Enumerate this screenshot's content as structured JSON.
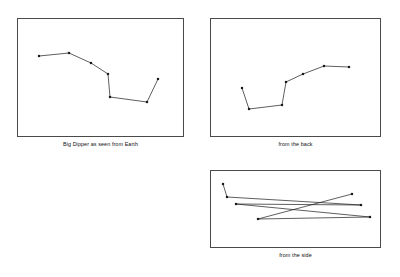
{
  "figure": {
    "background_color": "#ffffff",
    "stroke_color": "#1a1a1a",
    "frame_color": "#4a4a4a",
    "star_marker": "square"
  },
  "panels": [
    {
      "id": "earth",
      "caption": "Big Dipper as seen from Earth",
      "view": "front",
      "star_count": 7,
      "viewbox": "0 0 167 119",
      "stars": [
        {
          "name": "Alkaid",
          "x": 22,
          "y": 38
        },
        {
          "name": "Mizar",
          "x": 52,
          "y": 35
        },
        {
          "name": "Alioth",
          "x": 74,
          "y": 45
        },
        {
          "name": "Megrez",
          "x": 91,
          "y": 56
        },
        {
          "name": "Phecda",
          "x": 93,
          "y": 79
        },
        {
          "name": "Merak",
          "x": 130,
          "y": 84
        },
        {
          "name": "Dubhe",
          "x": 141,
          "y": 61
        }
      ],
      "path": "M22,38 L52,35 L74,45 L91,56 L93,79 L130,84 L141,61"
    },
    {
      "id": "back",
      "caption": "from the back",
      "view": "rear",
      "star_count": 7,
      "viewbox": "0 0 171 119",
      "stars": [
        {
          "name": "Alkaid",
          "x": 32,
          "y": 70
        },
        {
          "name": "Mizar",
          "x": 39,
          "y": 91
        },
        {
          "name": "Alioth",
          "x": 72,
          "y": 87
        },
        {
          "name": "Megrez",
          "x": 76,
          "y": 64
        },
        {
          "name": "Phecda",
          "x": 93,
          "y": 56
        },
        {
          "name": "Merak",
          "x": 114,
          "y": 48
        },
        {
          "name": "Dubhe",
          "x": 139,
          "y": 49
        }
      ],
      "path": "M32,70 L39,91 L72,87 L76,64 L93,56 L114,48 L139,49"
    },
    {
      "id": "side",
      "caption": "from the side",
      "view": "side",
      "star_count": 7,
      "viewbox": "0 0 171 78",
      "stars": [
        {
          "name": "Alkaid",
          "x": 13,
          "y": 14
        },
        {
          "name": "Mizar",
          "x": 17,
          "y": 27
        },
        {
          "name": "Alioth",
          "x": 151,
          "y": 35
        },
        {
          "name": "Megrez",
          "x": 26,
          "y": 34
        },
        {
          "name": "Phecda",
          "x": 160,
          "y": 47
        },
        {
          "name": "Merak",
          "x": 48,
          "y": 49
        },
        {
          "name": "Dubhe",
          "x": 142,
          "y": 24
        }
      ],
      "path": "M13,14 L17,27 L151,35 L26,34 L160,47 L48,49 L142,24"
    }
  ]
}
